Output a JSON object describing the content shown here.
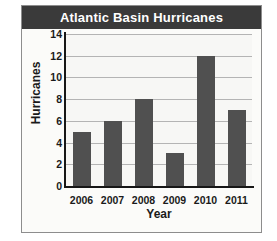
{
  "chart_data": {
    "type": "bar",
    "title": "Atlantic Basin Hurricanes",
    "xlabel": "Year",
    "ylabel": "Hurricanes",
    "categories": [
      "2006",
      "2007",
      "2008",
      "2009",
      "2010",
      "2011"
    ],
    "values": [
      5,
      6,
      8,
      3,
      12,
      7
    ],
    "ylim": [
      0,
      14
    ],
    "ytick_labels": [
      "0",
      "2",
      "4",
      "6",
      "8",
      "10",
      "12",
      "14"
    ],
    "ytick_values": [
      0,
      2,
      4,
      6,
      8,
      10,
      12,
      14
    ],
    "grid": true,
    "legend": null,
    "colors": {
      "bar": "#505050",
      "title_band": "#3a3a3a",
      "title_text": "#ffffff",
      "plot_background": "#f7f7f5",
      "gridline": "#b4b4b4",
      "axis": "#171717",
      "frame_border": "#8d8d8d",
      "page_background": "#ffffff"
    }
  }
}
